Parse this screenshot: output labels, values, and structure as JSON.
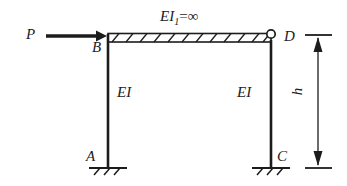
{
  "figure": {
    "type": "structural-frame-diagram",
    "background_color": "#ffffff",
    "line_color": "#1c1c1c"
  },
  "labels": {
    "load": "P",
    "joint_b": "B",
    "joint_d": "D",
    "support_a": "A",
    "support_c": "C",
    "column_left_stiffness": "EI",
    "column_right_stiffness": "EI",
    "beam_stiffness_symbol": "EI",
    "beam_stiffness_subscript": "1",
    "beam_stiffness_equals": "=",
    "beam_stiffness_value": "∞",
    "height_dimension": "h"
  },
  "geometry": {
    "beam_left_x": 108,
    "beam_right_x": 271,
    "beam_top_y": 34,
    "beam_bottom_y": 42,
    "column_left_x": 108,
    "column_right_x": 271,
    "column_top_y": 42,
    "ground_y": 168,
    "hinge_x": 271,
    "hinge_y": 35,
    "hinge_radius": 4,
    "load_arrow_start_x": 46,
    "load_arrow_end_x": 106,
    "load_arrow_y": 36,
    "dimension_x": 318,
    "dimension_top_y": 35,
    "dimension_bottom_y": 168
  },
  "elements": {
    "beam_name": "rigid-beam-BD",
    "column_left_name": "column-AB",
    "column_right_name": "column-CD",
    "support_a_name": "fixed-support-A",
    "support_c_name": "fixed-support-C",
    "hinge_name": "hinge-joint-D",
    "load_name": "horizontal-load-P",
    "dimension_name": "height-dimension-h"
  }
}
